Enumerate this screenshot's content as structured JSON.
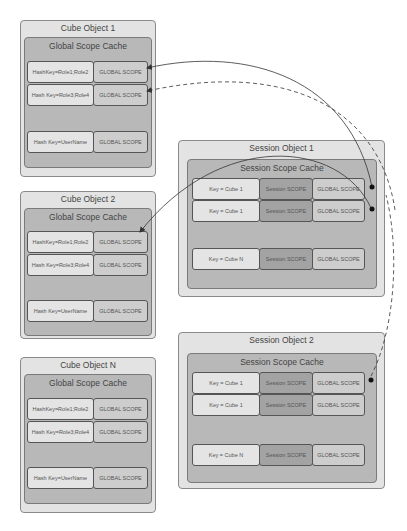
{
  "cube_objects": [
    {
      "title": "Cube Object 1",
      "cache_title": "Global Scope Cache",
      "rows": [
        {
          "key": "HashKey=Role1;Role2",
          "scope": "GLOBAL SCOPE"
        },
        {
          "key": "Hash Key=Role3;Role4",
          "scope": "GLOBAL SCOPE"
        },
        {
          "key": "Hash Key=UserName",
          "scope": "GLOBAL SCOPE"
        }
      ]
    },
    {
      "title": "Cube Object 2",
      "cache_title": "Global Scope Cache",
      "rows": [
        {
          "key": "HashKey=Role1;Role2",
          "scope": "GLOBAL SCOPE"
        },
        {
          "key": "Hash Key=Role3;Role4",
          "scope": "GLOBAL SCOPE"
        },
        {
          "key": "Hash Key=UserName",
          "scope": "GLOBAL SCOPE"
        }
      ]
    },
    {
      "title": "Cube Object N",
      "cache_title": "Global Scope Cache",
      "rows": [
        {
          "key": "HashKey=Role1;Role2",
          "scope": "GLOBAL SCOPE"
        },
        {
          "key": "Hash Key=Role3;Role4",
          "scope": "GLOBAL SCOPE"
        },
        {
          "key": "Hash Key=UserName",
          "scope": "GLOBAL SCOPE"
        }
      ]
    }
  ],
  "session_objects": [
    {
      "title": "Session Object 1",
      "cache_title": "Session Scope Cache",
      "rows": [
        {
          "key": "Key = Cube 1",
          "session": "Session SCOPE",
          "global": "GLOBAL SCOPE"
        },
        {
          "key": "Key = Cube 1",
          "session": "Session SCOPE",
          "global": "GLOBAL SCOPE"
        },
        {
          "key": "Key = Cube N",
          "session": "Session SCOPE",
          "global": "GLOBAL SCOPE"
        }
      ]
    },
    {
      "title": "Session Object 2",
      "cache_title": "Session Scope Cache",
      "rows": [
        {
          "key": "Key = Cube 1",
          "session": "Session SCOPE",
          "global": "GLOBAL SCOPE"
        },
        {
          "key": "Key = Cube 1",
          "session": "Session SCOPE",
          "global": "GLOBAL SCOPE"
        },
        {
          "key": "Key = Cube N",
          "session": "Session SCOPE",
          "global": "GLOBAL SCOPE"
        }
      ]
    }
  ],
  "colors": {
    "object_fill": "#e3e3e3",
    "cache_fill": "#b8b8b8",
    "cell_light": "#e4e4e4",
    "cell_mid": "#cdcdcd",
    "cell_dark": "#a3a3a3",
    "connector": "#333333"
  }
}
